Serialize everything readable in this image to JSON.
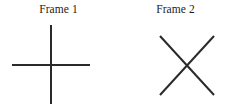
{
  "figure": {
    "width": 234,
    "height": 107,
    "background_color": "#ffffff",
    "stroke_color": "#2a2a2a",
    "stroke_width": 2
  },
  "panels": [
    {
      "caption": "Frame 1",
      "glyph_name": "plus-cross-glyph",
      "glyph_description": "upright cross / plus sign",
      "strokes": [
        {
          "name": "vertical-stroke",
          "x1": 51,
          "y1": 25,
          "x2": 51,
          "y2": 104
        },
        {
          "name": "horizontal-stroke",
          "x1": 12,
          "y1": 65,
          "x2": 90,
          "y2": 65
        }
      ]
    },
    {
      "caption": "Frame 2",
      "glyph_name": "x-cross-glyph",
      "glyph_description": "rotated cross / X shape",
      "strokes": [
        {
          "name": "diagonal-stroke-down-right",
          "x1": 160,
          "y1": 36,
          "x2": 214,
          "y2": 95
        },
        {
          "name": "diagonal-stroke-up-right",
          "x1": 214,
          "y1": 36,
          "x2": 160,
          "y2": 95
        }
      ]
    }
  ]
}
